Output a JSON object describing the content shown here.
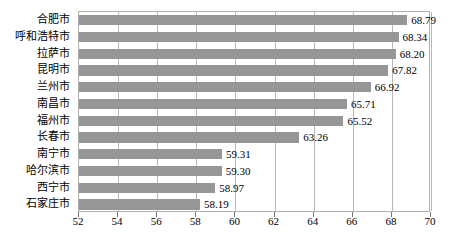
{
  "chart_data": {
    "type": "bar",
    "orientation": "horizontal",
    "title": "",
    "xlabel": "",
    "ylabel": "",
    "xlim": [
      52,
      70
    ],
    "xticks": [
      52,
      54,
      56,
      58,
      60,
      62,
      64,
      66,
      68,
      70
    ],
    "grid": true,
    "legend": false,
    "bar_color": "#969696",
    "categories": [
      "合肥市",
      "呼和浩特市",
      "拉萨市",
      "昆明市",
      "兰州市",
      "南昌市",
      "福州市",
      "长春市",
      "南宁市",
      "哈尔滨市",
      "西宁市",
      "石家庄市"
    ],
    "values": [
      68.79,
      68.34,
      68.2,
      67.82,
      66.92,
      65.71,
      65.52,
      63.26,
      59.31,
      59.3,
      58.97,
      58.19
    ],
    "value_labels": [
      "68.79",
      "68.34",
      "68.20",
      "67.82",
      "66.92",
      "65.71",
      "65.52",
      "63.26",
      "59.31",
      "59.30",
      "58.97",
      "58.19"
    ]
  }
}
